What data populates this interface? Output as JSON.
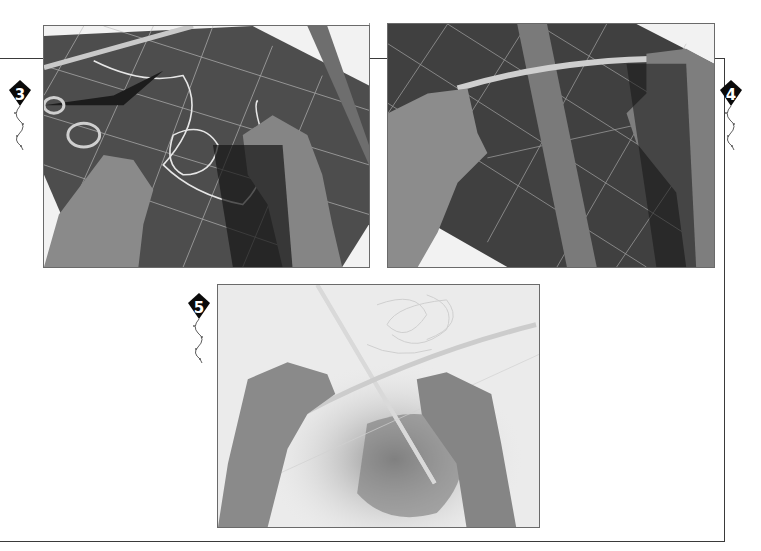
{
  "page": {
    "background": "#ffffff",
    "frame_color": "#3a3a3a"
  },
  "steps": [
    {
      "number": "3",
      "marker_icon": "kite-icon",
      "photo_description": "Hands arranging string on a gridded cutting mat with scissors, a dowel and a metal ruler"
    },
    {
      "number": "4",
      "marker_icon": "kite-icon",
      "photo_description": "Hands bending a cane rod into a bow across a cutting mat with a metal ruler"
    },
    {
      "number": "5",
      "marker_icon": "kite-icon",
      "photo_description": "Hands tying string where the bowed cane crosses the straight spine dowel"
    }
  ]
}
